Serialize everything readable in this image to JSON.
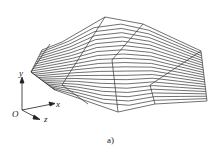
{
  "figure": {
    "caption": "a)",
    "type": "3D wireframe surface mesh",
    "axes": {
      "x": "x",
      "y": "y",
      "z": "z",
      "origin": "O"
    },
    "colors": {
      "line": "#333333",
      "background": "#ffffff"
    },
    "mesh": {
      "outline": [
        [
          31,
          72
        ],
        [
          42,
          50
        ],
        [
          62,
          42
        ],
        [
          105,
          17
        ],
        [
          143,
          24
        ],
        [
          201,
          51
        ],
        [
          207,
          101
        ],
        [
          155,
          104
        ],
        [
          118,
          112
        ],
        [
          55,
          90
        ]
      ],
      "top_edge": [
        [
          42,
          50
        ],
        [
          62,
          42
        ],
        [
          105,
          17
        ],
        [
          143,
          24
        ],
        [
          201,
          51
        ]
      ],
      "bottom_edge": [
        [
          55,
          90
        ],
        [
          118,
          112
        ],
        [
          155,
          104
        ],
        [
          207,
          101
        ]
      ],
      "strip_lines": 22,
      "cross_lines": [
        [
          [
            50,
            44
          ],
          [
            31,
            72
          ],
          [
            55,
            90
          ]
        ],
        [
          [
            105,
            17
          ],
          [
            62,
            85
          ],
          [
            88,
            104
          ]
        ],
        [
          [
            143,
            24
          ],
          [
            112,
            60
          ],
          [
            118,
            112
          ]
        ],
        [
          [
            201,
            51
          ],
          [
            150,
            85
          ],
          [
            155,
            104
          ]
        ]
      ]
    }
  }
}
